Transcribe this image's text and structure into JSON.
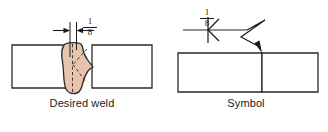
{
  "figure": {
    "type": "welding-symbol-diagram",
    "joint_type": "double-bevel-groove-weld",
    "background_color": "#ffffff",
    "line_color": "#1a1a1a",
    "bead_fill_color": "#e8c4ad",
    "bead_outline_color": "#2a2a2a",
    "plate_fill_color": "#ffffff"
  },
  "left_view": {
    "caption": "Desired weld",
    "dimension": {
      "numerator": "1",
      "denominator": "8",
      "label": "1/8",
      "meaning": "root-opening"
    }
  },
  "right_view": {
    "caption": "Symbol",
    "dimension": {
      "numerator": "1",
      "denominator": "8",
      "label": "1/8",
      "meaning": "root-opening"
    }
  }
}
